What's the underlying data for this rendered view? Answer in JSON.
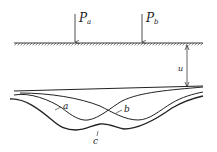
{
  "diagram": {
    "loads": [
      {
        "symbol": "P",
        "subscript": "a",
        "x": 75
      },
      {
        "symbol": "P",
        "subscript": "b",
        "x": 142
      }
    ],
    "dimension_label": "u",
    "curve_labels": {
      "a": "a",
      "b": "b",
      "c": "c"
    },
    "colors": {
      "line": "#222222",
      "background": "#ffffff"
    }
  }
}
